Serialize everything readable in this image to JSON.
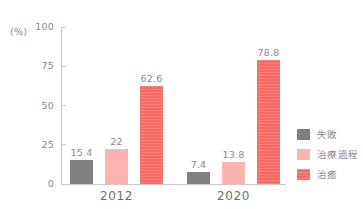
{
  "chart_data": {
    "type": "bar",
    "title": "",
    "xlabel": "",
    "ylabel": "(%)",
    "ylim": [
      0,
      100
    ],
    "yticks": [
      "0",
      "25",
      "50",
      "75",
      "100"
    ],
    "ytick_values": [
      0,
      25,
      50,
      75,
      100
    ],
    "grid": false,
    "legend_position": "right",
    "categories": [
      "2012",
      "2020"
    ],
    "series": [
      {
        "name": "失敗",
        "color": "#7f7f7f",
        "values": [
          15.4,
          7.4
        ],
        "labels": [
          "15.4",
          "7.4"
        ]
      },
      {
        "name": "治療過程",
        "color": "#fab5b0",
        "values": [
          22,
          13.8
        ],
        "labels": [
          "22",
          "13.8"
        ]
      },
      {
        "name": "治癒",
        "color": "#f76a66",
        "values": [
          62.6,
          78.8
        ],
        "labels": [
          "62.6",
          "78.8"
        ]
      }
    ]
  },
  "axis": {
    "unit_label": "(%)"
  },
  "colors": {
    "fail": "#7f7f7f",
    "process": "#fab5b0",
    "cure": "#f76a66",
    "axis": "#c9c9c9",
    "text": "#8a8a8a",
    "category_text": "#6e6e6e",
    "background": "#ffffff"
  }
}
